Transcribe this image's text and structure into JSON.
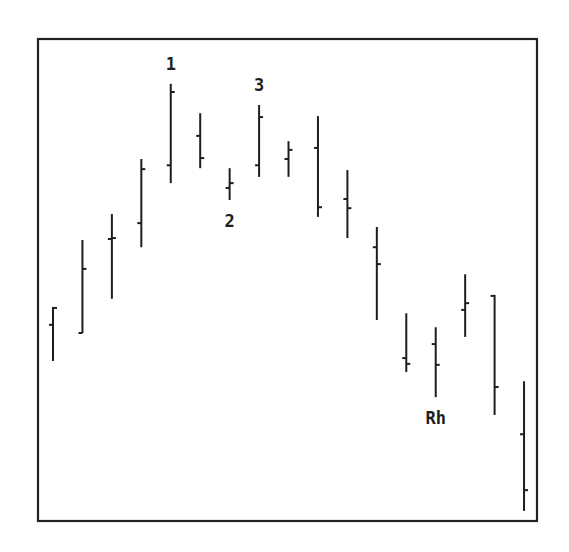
{
  "chart_data": {
    "type": "ohlc",
    "title": "",
    "xlabel": "",
    "ylabel": "",
    "grid": false,
    "legend": "none",
    "ylim": [
      0,
      100
    ],
    "bars": [
      {
        "index": 1,
        "open": 40.7,
        "high": 44.4,
        "low": 33.2,
        "close": 44.2
      },
      {
        "index": 2,
        "open": 39.0,
        "high": 58.3,
        "low": 39.0,
        "close": 52.3
      },
      {
        "index": 3,
        "open": 58.5,
        "high": 63.7,
        "low": 46.1,
        "close": 58.7
      },
      {
        "index": 4,
        "open": 61.8,
        "high": 75.1,
        "low": 56.8,
        "close": 73.0
      },
      {
        "index": 5,
        "open": 73.8,
        "high": 90.7,
        "low": 70.1,
        "close": 89.0
      },
      {
        "index": 6,
        "open": 79.9,
        "high": 84.6,
        "low": 73.2,
        "close": 75.3
      },
      {
        "index": 7,
        "open": 69.1,
        "high": 73.2,
        "low": 66.6,
        "close": 70.1
      },
      {
        "index": 8,
        "open": 73.8,
        "high": 86.3,
        "low": 71.4,
        "close": 83.8
      },
      {
        "index": 9,
        "open": 75.1,
        "high": 78.8,
        "low": 71.4,
        "close": 77.0
      },
      {
        "index": 10,
        "open": 77.4,
        "high": 84.0,
        "low": 63.1,
        "close": 65.1
      },
      {
        "index": 11,
        "open": 66.8,
        "high": 72.8,
        "low": 58.7,
        "close": 64.9
      },
      {
        "index": 12,
        "open": 56.8,
        "high": 61.0,
        "low": 41.7,
        "close": 53.3
      },
      {
        "index": 13,
        "open": 33.8,
        "high": 43.1,
        "low": 30.9,
        "close": 32.6
      },
      {
        "index": 14,
        "open": 36.7,
        "high": 40.2,
        "low": 25.7,
        "close": 32.4
      },
      {
        "index": 15,
        "open": 43.8,
        "high": 51.2,
        "low": 38.2,
        "close": 45.2
      },
      {
        "index": 16,
        "open": 46.7,
        "high": 46.9,
        "low": 22.0,
        "close": 27.8
      },
      {
        "index": 17,
        "open": 18.0,
        "high": 29.0,
        "low": 2.1,
        "close": 6.4
      }
    ],
    "annotations": [
      {
        "text": "1",
        "bar": 5,
        "position": "above"
      },
      {
        "text": "2",
        "bar": 7,
        "position": "below"
      },
      {
        "text": "3",
        "bar": 8,
        "position": "above"
      },
      {
        "text": "Rh",
        "bar": 14,
        "position": "below"
      }
    ]
  }
}
